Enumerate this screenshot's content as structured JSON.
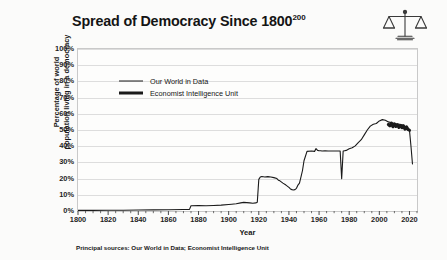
{
  "title": {
    "main": "Spread of Democracy Since 1800",
    "superscript": "200"
  },
  "icon": {
    "name": "scales-of-justice-icon"
  },
  "footnote": "Principal sources: Our World in Data; Economist Intelligence Unit",
  "colors": {
    "line": "#1a1a1a",
    "grid": "#dddddd",
    "frame": "#c9c9c9",
    "background": "#fbfbfa",
    "text": "#1b1b1b"
  },
  "legend": {
    "position": "inside-top-left",
    "entries": [
      {
        "label": "Our World in Data",
        "style": "thin"
      },
      {
        "label": "Economist Intelligence Unit",
        "style": "thick"
      }
    ]
  },
  "chart_data": {
    "type": "line",
    "title": "Spread of Democracy Since 1800",
    "xlabel": "Year",
    "ylabel": "Percentage of world population living in a democracy",
    "ylabel_line1": "Percentage of world",
    "ylabel_line2": "population living in a democracy",
    "xlim": [
      1800,
      2025
    ],
    "ylim": [
      0,
      100
    ],
    "grid": true,
    "y_ticks": [
      0,
      10,
      20,
      30,
      40,
      50,
      60,
      70,
      80,
      90,
      100
    ],
    "y_tick_labels": [
      "0%",
      "10%",
      "20%",
      "30%",
      "40%",
      "50%",
      "60%",
      "70%",
      "80%",
      "90%",
      "100%"
    ],
    "x_ticks": [
      1800,
      1820,
      1840,
      1860,
      1880,
      1900,
      1920,
      1940,
      1960,
      1980,
      2000,
      2020
    ],
    "x_tick_labels": [
      "1800",
      "1820",
      "1840",
      "1860",
      "1880",
      "1900",
      "1920",
      "1940",
      "1960",
      "1980",
      "2000",
      "2020"
    ],
    "x_minor_tick_step": 5,
    "legend": [
      "Our World in Data",
      "Economist Intelligence Unit"
    ],
    "series": [
      {
        "name": "Our World in Data",
        "style": "thin",
        "x": [
          1800,
          1810,
          1820,
          1830,
          1840,
          1850,
          1860,
          1870,
          1874,
          1875,
          1880,
          1885,
          1890,
          1895,
          1900,
          1902,
          1905,
          1908,
          1910,
          1912,
          1914,
          1916,
          1918,
          1919,
          1920,
          1921,
          1922,
          1924,
          1926,
          1928,
          1930,
          1932,
          1933,
          1934,
          1936,
          1938,
          1940,
          1941,
          1942,
          1943,
          1944,
          1945,
          1946,
          1947,
          1948,
          1949,
          1950,
          1952,
          1955,
          1957,
          1958,
          1959,
          1960,
          1961,
          1962,
          1964,
          1966,
          1968,
          1970,
          1972,
          1974,
          1975,
          1976,
          1977,
          1978,
          1980,
          1982,
          1984,
          1986,
          1988,
          1990,
          1992,
          1994,
          1996,
          1998,
          2000,
          2002,
          2004,
          2006,
          2008,
          2010,
          2012,
          2014,
          2016,
          2018,
          2020,
          2021,
          2022
        ],
        "y": [
          0.4,
          0.4,
          0.5,
          0.5,
          0.6,
          0.7,
          0.8,
          0.9,
          1.0,
          3.2,
          3.3,
          3.2,
          3.4,
          3.6,
          4.0,
          4.2,
          4.5,
          5.0,
          5.3,
          5.2,
          5.0,
          4.8,
          5.0,
          5.4,
          19.5,
          21.0,
          21.3,
          21.0,
          21.2,
          21.0,
          20.6,
          20.0,
          19.0,
          18.6,
          17.2,
          16.0,
          14.6,
          13.6,
          13.2,
          13.0,
          13.2,
          14.0,
          16.0,
          17.2,
          21.0,
          25.0,
          31.0,
          36.8,
          37.0,
          36.8,
          38.5,
          37.4,
          37.2,
          37.2,
          37.0,
          37.1,
          37.0,
          37.0,
          37.0,
          37.0,
          37.0,
          20.0,
          37.0,
          37.2,
          37.4,
          38.4,
          39.0,
          40.2,
          42.2,
          44.0,
          47.0,
          50.0,
          52.4,
          53.6,
          54.0,
          55.6,
          56.4,
          56.0,
          55.0,
          54.5,
          54.0,
          53.8,
          53.4,
          53.0,
          51.0,
          49.8,
          40.0,
          29.0
        ]
      },
      {
        "name": "Economist Intelligence Unit",
        "style": "thick",
        "x": [
          2006,
          2007,
          2008,
          2009,
          2010,
          2011,
          2012,
          2013,
          2014,
          2015,
          2016,
          2017,
          2018,
          2019,
          2020
        ],
        "y": [
          53.4,
          52.6,
          54.2,
          52.0,
          53.8,
          52.2,
          53.2,
          51.6,
          52.8,
          51.4,
          52.6,
          50.6,
          52.0,
          50.4,
          49.8
        ]
      }
    ]
  }
}
